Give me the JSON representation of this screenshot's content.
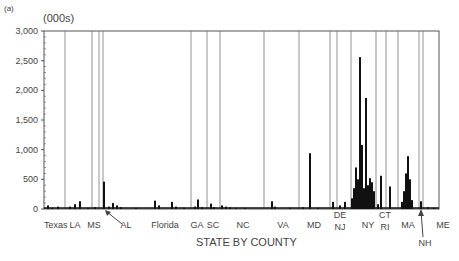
{
  "chart_data": {
    "type": "bar",
    "panel_label": "(a)",
    "title": "",
    "ylabel": "(000s)",
    "xlabel": "STATE BY COUNTY",
    "ylim": [
      0,
      3000
    ],
    "yticks": [
      0,
      500,
      1000,
      1500,
      2000,
      2500,
      3000
    ],
    "ytick_labels": [
      "0",
      "500",
      "1,000",
      "1,500",
      "2,000",
      "2,500",
      "3,000"
    ],
    "grid": false,
    "legend": null,
    "x_range_px": [
      44,
      439
    ],
    "state_separators_px": [
      65,
      92,
      99,
      103,
      191,
      207,
      220,
      264,
      299,
      330,
      337,
      351,
      376,
      386,
      398,
      419,
      423
    ],
    "state_labels": [
      {
        "label": "Texas",
        "x": 44,
        "row": 0
      },
      {
        "label": "LA",
        "x": 75,
        "row": 0
      },
      {
        "label": "MS",
        "x": 94,
        "row": 0
      },
      {
        "label": "AL",
        "x": 126,
        "row": 0,
        "arrow_to": 104
      },
      {
        "label": "Florida",
        "x": 165,
        "row": 0
      },
      {
        "label": "GA",
        "x": 197,
        "row": 0
      },
      {
        "label": "SC",
        "x": 213,
        "row": 0
      },
      {
        "label": "NC",
        "x": 243,
        "row": 0
      },
      {
        "label": "VA",
        "x": 283,
        "row": 0
      },
      {
        "label": "MD",
        "x": 314,
        "row": 0
      },
      {
        "label": "DE",
        "x": 340,
        "row": -1
      },
      {
        "label": "NJ",
        "x": 340,
        "row": 1
      },
      {
        "label": "NY",
        "x": 368,
        "row": 0
      },
      {
        "label": "CT",
        "x": 385,
        "row": -1
      },
      {
        "label": "RI",
        "x": 385,
        "row": 1
      },
      {
        "label": "MA",
        "x": 408,
        "row": 0
      },
      {
        "label": "NH",
        "x": 425,
        "row": 2,
        "arrow_to": 421
      },
      {
        "label": "ME",
        "x": 443,
        "row": 0
      }
    ],
    "bars": [
      {
        "state": "Texas",
        "x": 48,
        "value": 60
      },
      {
        "state": "Texas",
        "x": 52,
        "value": 20
      },
      {
        "state": "Texas",
        "x": 58,
        "value": 40
      },
      {
        "state": "LA",
        "x": 70,
        "value": 40
      },
      {
        "state": "LA",
        "x": 75,
        "value": 80
      },
      {
        "state": "LA",
        "x": 80,
        "value": 130
      },
      {
        "state": "MS",
        "x": 88,
        "value": 20
      },
      {
        "state": "MS",
        "x": 95,
        "value": 30
      },
      {
        "state": "AL",
        "x": 104,
        "value": 460
      },
      {
        "state": "AL",
        "x": 109,
        "value": 40
      },
      {
        "state": "AL",
        "x": 113,
        "value": 100
      },
      {
        "state": "AL",
        "x": 117,
        "value": 60
      },
      {
        "state": "AL",
        "x": 121,
        "value": 30
      },
      {
        "state": "Florida",
        "x": 136,
        "value": 20
      },
      {
        "state": "Florida",
        "x": 155,
        "value": 140
      },
      {
        "state": "Florida",
        "x": 159,
        "value": 60
      },
      {
        "state": "Florida",
        "x": 172,
        "value": 120
      },
      {
        "state": "Florida",
        "x": 176,
        "value": 40
      },
      {
        "state": "Florida",
        "x": 184,
        "value": 20
      },
      {
        "state": "GA",
        "x": 195,
        "value": 40
      },
      {
        "state": "GA",
        "x": 198,
        "value": 160
      },
      {
        "state": "GA",
        "x": 202,
        "value": 30
      },
      {
        "state": "SC",
        "x": 211,
        "value": 90
      },
      {
        "state": "SC",
        "x": 214,
        "value": 30
      },
      {
        "state": "NC",
        "x": 222,
        "value": 60
      },
      {
        "state": "NC",
        "x": 226,
        "value": 40
      },
      {
        "state": "NC",
        "x": 230,
        "value": 30
      },
      {
        "state": "NC",
        "x": 236,
        "value": 20
      },
      {
        "state": "NC",
        "x": 245,
        "value": 20
      },
      {
        "state": "VA",
        "x": 272,
        "value": 130
      },
      {
        "state": "VA",
        "x": 275,
        "value": 40
      },
      {
        "state": "VA",
        "x": 290,
        "value": 20
      },
      {
        "state": "MD",
        "x": 303,
        "value": 30
      },
      {
        "state": "MD",
        "x": 310,
        "value": 940
      },
      {
        "state": "MD",
        "x": 318,
        "value": 20
      },
      {
        "state": "DE",
        "x": 333,
        "value": 120
      },
      {
        "state": "NJ",
        "x": 340,
        "value": 60
      },
      {
        "state": "NJ",
        "x": 345,
        "value": 120
      },
      {
        "state": "NY",
        "x": 352,
        "value": 180
      },
      {
        "state": "NY",
        "x": 354,
        "value": 350
      },
      {
        "state": "NY",
        "x": 356,
        "value": 700
      },
      {
        "state": "NY",
        "x": 358,
        "value": 500
      },
      {
        "state": "NY",
        "x": 360,
        "value": 2560
      },
      {
        "state": "NY",
        "x": 362,
        "value": 1080
      },
      {
        "state": "NY",
        "x": 364,
        "value": 350
      },
      {
        "state": "NY",
        "x": 366,
        "value": 1870
      },
      {
        "state": "NY",
        "x": 368,
        "value": 400
      },
      {
        "state": "NY",
        "x": 370,
        "value": 520
      },
      {
        "state": "NY",
        "x": 372,
        "value": 450
      },
      {
        "state": "NY",
        "x": 374,
        "value": 300
      },
      {
        "state": "CT",
        "x": 378,
        "value": 80
      },
      {
        "state": "CT",
        "x": 381,
        "value": 560
      },
      {
        "state": "RI",
        "x": 390,
        "value": 380
      },
      {
        "state": "MA",
        "x": 402,
        "value": 120
      },
      {
        "state": "MA",
        "x": 404,
        "value": 300
      },
      {
        "state": "MA",
        "x": 406,
        "value": 600
      },
      {
        "state": "MA",
        "x": 408,
        "value": 890
      },
      {
        "state": "MA",
        "x": 410,
        "value": 500
      },
      {
        "state": "MA",
        "x": 412,
        "value": 150
      },
      {
        "state": "NH",
        "x": 421,
        "value": 130
      },
      {
        "state": "ME",
        "x": 428,
        "value": 30
      },
      {
        "state": "ME",
        "x": 434,
        "value": 20
      }
    ]
  },
  "colors": {
    "bar": "#111111",
    "axis": "#555555",
    "separator": "#777777",
    "text": "#444444"
  }
}
